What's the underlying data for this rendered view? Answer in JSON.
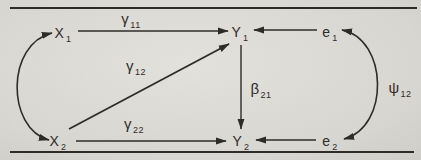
{
  "diagram": {
    "type": "path-diagram",
    "background_color": "#dcdad5",
    "ink_color": "#2e2c29",
    "nodes": {
      "x1": {
        "symbol": "X",
        "subscript": "1"
      },
      "x2": {
        "symbol": "X",
        "subscript": "2"
      },
      "y1": {
        "symbol": "Y",
        "subscript": "1"
      },
      "y2": {
        "symbol": "Y",
        "subscript": "2"
      },
      "e1": {
        "symbol": "e",
        "subscript": "1"
      },
      "e2": {
        "symbol": "e",
        "subscript": "2"
      }
    },
    "coefficients": {
      "gamma11": {
        "symbol": "γ",
        "subscript": "11"
      },
      "gamma12": {
        "symbol": "γ",
        "subscript": "12"
      },
      "gamma22": {
        "symbol": "γ",
        "subscript": "22"
      },
      "beta21": {
        "symbol": "β",
        "subscript": "21"
      },
      "psi12": {
        "symbol": "ψ",
        "subscript": "12"
      }
    },
    "edges": [
      {
        "from": "X1",
        "to": "Y1",
        "style": "straight-arrow",
        "label": "γ11"
      },
      {
        "from": "X2",
        "to": "Y1",
        "style": "straight-arrow",
        "label": "γ12"
      },
      {
        "from": "X2",
        "to": "Y2",
        "style": "straight-arrow",
        "label": "γ22"
      },
      {
        "from": "Y1",
        "to": "Y2",
        "style": "straight-arrow",
        "label": "β21"
      },
      {
        "from": "e1",
        "to": "Y1",
        "style": "straight-arrow",
        "label": null
      },
      {
        "from": "e2",
        "to": "Y2",
        "style": "straight-arrow",
        "label": null
      },
      {
        "from": "X1",
        "to": "X2",
        "style": "curved-double-headed",
        "label": null
      },
      {
        "from": "e1",
        "to": "e2",
        "style": "curved-double-headed",
        "label": "ψ12"
      }
    ]
  }
}
